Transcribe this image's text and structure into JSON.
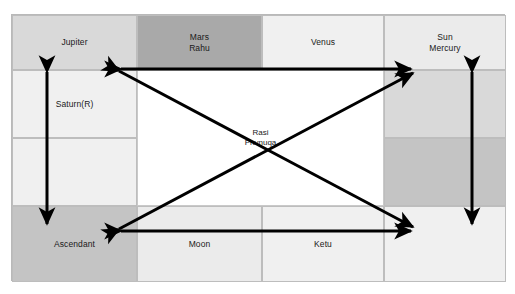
{
  "chart": {
    "style": "south-indian-square-grid",
    "center_label": "Rasi\nPhvnuqa",
    "colors": {
      "dark": "#a9a9a9",
      "mid": "#c4c4c4",
      "light": "#d9d9d9",
      "pale": "#ebebeb",
      "faint": "#f0f0f0",
      "center": "#ffffff",
      "arrow": "#000000",
      "border": "#bdbdbd"
    },
    "cells": [
      {
        "id": "top-1",
        "label": "Jupiter",
        "shade": "light"
      },
      {
        "id": "top-2",
        "label": "Mars\nRahu",
        "shade": "dark"
      },
      {
        "id": "top-3",
        "label": "Venus",
        "shade": "faint"
      },
      {
        "id": "top-4",
        "label": "Sun\nMercury",
        "shade": "pale"
      },
      {
        "id": "left-1",
        "label": "Saturn(R)",
        "shade": "faint"
      },
      {
        "id": "left-2",
        "label": "",
        "shade": "faint"
      },
      {
        "id": "right-1",
        "label": "",
        "shade": "light"
      },
      {
        "id": "right-2",
        "label": "",
        "shade": "mid"
      },
      {
        "id": "bottom-1",
        "label": "Ascendant",
        "shade": "mid"
      },
      {
        "id": "bottom-2",
        "label": "Moon",
        "shade": "pale"
      },
      {
        "id": "bottom-3",
        "label": "Ketu",
        "shade": "faint"
      },
      {
        "id": "bottom-4",
        "label": "",
        "shade": "faint"
      }
    ],
    "arrows": [
      {
        "id": "arrow-top-horizontal",
        "kind": "double-headed",
        "orientation": "horizontal"
      },
      {
        "id": "arrow-bottom-horizontal",
        "kind": "double-headed",
        "orientation": "horizontal"
      },
      {
        "id": "arrow-left-vertical",
        "kind": "double-headed",
        "orientation": "vertical"
      },
      {
        "id": "arrow-right-vertical",
        "kind": "double-headed",
        "orientation": "vertical"
      },
      {
        "id": "arrow-diagonal-tl-br",
        "kind": "double-headed",
        "orientation": "diagonal"
      },
      {
        "id": "arrow-diagonal-bl-tr",
        "kind": "double-headed",
        "orientation": "diagonal"
      }
    ]
  }
}
